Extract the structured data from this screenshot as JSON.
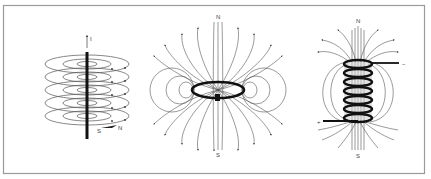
{
  "figure": {
    "frame_color": "#9a9a9a",
    "line_color": "#333333",
    "panels": [
      {
        "id": "straight-wire",
        "labels": {
          "current": "I",
          "south": "S",
          "north": "N"
        }
      },
      {
        "id": "current-loop",
        "labels": {
          "north": "N",
          "south": "S"
        }
      },
      {
        "id": "solenoid",
        "labels": {
          "north": "N",
          "south": "S",
          "minus": "−",
          "plus": "+"
        }
      }
    ]
  }
}
